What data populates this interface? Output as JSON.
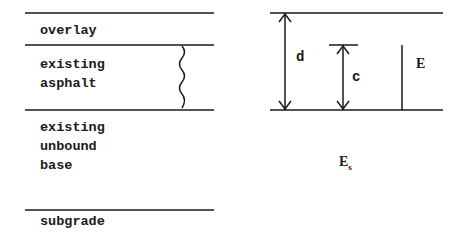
{
  "layers": {
    "overlay": "overlay",
    "existing_asphalt_1": "existing",
    "existing_asphalt_2": "asphalt",
    "base_1": "existing",
    "base_2": "unbound",
    "base_3": "base",
    "subgrade": "subgrade"
  },
  "symbols": {
    "d": "d",
    "c": "c",
    "E": "E",
    "Es_main": "E",
    "Es_sub": "s"
  },
  "colors": {
    "line": "#1a1a1a",
    "background": "#ffffff"
  }
}
